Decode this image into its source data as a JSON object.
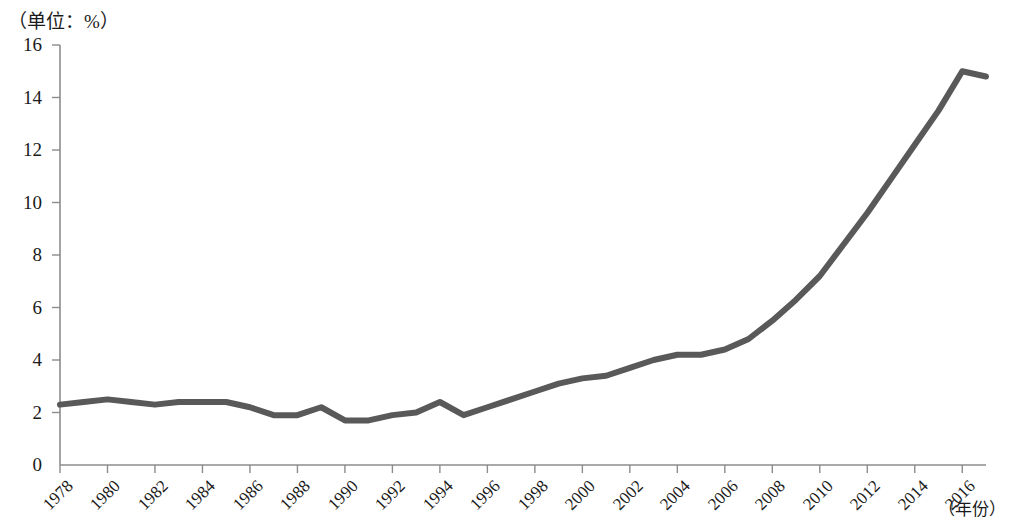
{
  "chart_data": {
    "type": "line",
    "title": "（单位：%）",
    "xlabel": "（年份）",
    "ylabel": "",
    "unit_label": "（单位：%）",
    "year_label": "（年份）",
    "xlim": [
      1978,
      2017
    ],
    "ylim": [
      0,
      16
    ],
    "ytick_labels": [
      "0",
      "2",
      "4",
      "6",
      "8",
      "10",
      "12",
      "14",
      "16"
    ],
    "ytick_values": [
      0,
      2,
      4,
      6,
      8,
      10,
      12,
      14,
      16
    ],
    "xtick_labels": [
      "1978",
      "1980",
      "1982",
      "1984",
      "1986",
      "1988",
      "1990",
      "1992",
      "1994",
      "1996",
      "1998",
      "2000",
      "2002",
      "2004",
      "2006",
      "2008",
      "2010",
      "2012",
      "2014",
      "2016"
    ],
    "xtick_values": [
      1978,
      1980,
      1982,
      1984,
      1986,
      1988,
      1990,
      1992,
      1994,
      1996,
      1998,
      2000,
      2002,
      2004,
      2006,
      2008,
      2010,
      2012,
      2014,
      2016
    ],
    "grid": false,
    "legend": null,
    "series": [
      {
        "name": "",
        "color": "#595959",
        "x": [
          1978,
          1979,
          1980,
          1981,
          1982,
          1983,
          1984,
          1985,
          1986,
          1987,
          1988,
          1989,
          1990,
          1991,
          1992,
          1993,
          1994,
          1995,
          1996,
          1997,
          1998,
          1999,
          2000,
          2001,
          2002,
          2003,
          2004,
          2005,
          2006,
          2007,
          2008,
          2009,
          2010,
          2011,
          2012,
          2013,
          2014,
          2015,
          2016,
          2017
        ],
        "values": [
          2.3,
          2.4,
          2.5,
          2.4,
          2.3,
          2.4,
          2.4,
          2.4,
          2.2,
          1.9,
          1.9,
          2.2,
          1.7,
          1.7,
          1.9,
          2.0,
          2.4,
          1.9,
          2.2,
          2.5,
          2.8,
          3.1,
          3.3,
          3.4,
          3.7,
          4.0,
          4.2,
          4.2,
          4.4,
          4.8,
          5.5,
          6.3,
          7.2,
          8.4,
          9.6,
          10.9,
          12.2,
          13.5,
          15.0,
          14.8
        ]
      }
    ]
  },
  "axis": {
    "y_title": "（单位：%）",
    "x_title": "（年份）"
  }
}
